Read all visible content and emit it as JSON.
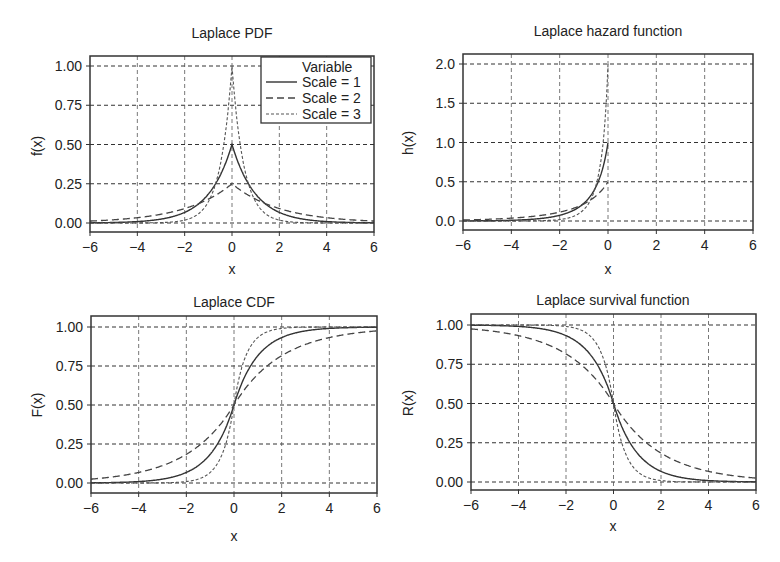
{
  "legend": {
    "title": "Variable",
    "entries": [
      "Scale = 1",
      "Scale = 2",
      "Scale = 3"
    ]
  },
  "panels": [
    {
      "id": "pdf",
      "title": "Laplace PDF",
      "ylabel": "f(x)",
      "xlabel": "x",
      "yticks": [
        "0.00",
        "0.25",
        "0.50",
        "0.75",
        "1.00"
      ],
      "xticks": [
        "−6",
        "−4",
        "−2",
        "0",
        "2",
        "4",
        "6"
      ]
    },
    {
      "id": "hazard",
      "title": "Laplace hazard function",
      "ylabel": "h(x)",
      "xlabel": "x",
      "yticks": [
        "0.0",
        "0.5",
        "1.0",
        "1.5",
        "2.0"
      ],
      "xticks": [
        "−6",
        "−4",
        "−2",
        "0",
        "2",
        "4",
        "6"
      ]
    },
    {
      "id": "cdf",
      "title": "Laplace CDF",
      "ylabel": "F(x)",
      "xlabel": "x",
      "yticks": [
        "0.00",
        "0.25",
        "0.50",
        "0.75",
        "1.00"
      ],
      "xticks": [
        "−6",
        "−4",
        "−2",
        "0",
        "2",
        "4",
        "6"
      ]
    },
    {
      "id": "survival",
      "title": "Laplace survival function",
      "ylabel": "R(x)",
      "xlabel": "x",
      "yticks": [
        "0.00",
        "0.25",
        "0.50",
        "0.75",
        "1.00"
      ],
      "xticks": [
        "−6",
        "−4",
        "−2",
        "0",
        "2",
        "4",
        "6"
      ]
    }
  ],
  "chart_data": [
    {
      "type": "line",
      "title": "Laplace PDF",
      "xlabel": "x",
      "ylabel": "f(x)",
      "xlim": [
        -6,
        6
      ],
      "ylim": [
        -0.05,
        1.05
      ],
      "xticks": [
        -6,
        -4,
        -2,
        0,
        2,
        4,
        6
      ],
      "yticks": [
        0.0,
        0.25,
        0.5,
        0.75,
        1.0
      ],
      "grid": true,
      "legend": {
        "title": "Variable",
        "position": "upper right"
      },
      "x": [
        -6,
        -4,
        -2,
        -1,
        -0.5,
        0,
        0.5,
        1,
        2,
        4,
        6
      ],
      "series": [
        {
          "name": "Scale = 1",
          "style": "solid",
          "values": [
            0.001,
            0.009,
            0.068,
            0.184,
            0.303,
            0.5,
            0.303,
            0.184,
            0.068,
            0.009,
            0.001
          ]
        },
        {
          "name": "Scale = 2",
          "style": "dashed",
          "values": [
            0.012,
            0.034,
            0.092,
            0.152,
            0.195,
            0.25,
            0.195,
            0.152,
            0.092,
            0.034,
            0.012
          ]
        },
        {
          "name": "Scale = 3",
          "style": "dotted",
          "values": [
            0.0,
            0.0,
            0.018,
            0.135,
            0.368,
            1.0,
            0.368,
            0.135,
            0.018,
            0.0,
            0.0
          ]
        }
      ]
    },
    {
      "type": "line",
      "title": "Laplace hazard function",
      "xlabel": "x",
      "ylabel": "h(x)",
      "xlim": [
        -6,
        6
      ],
      "ylim": [
        -0.1,
        2.1
      ],
      "xticks": [
        -6,
        -4,
        -2,
        0,
        2,
        4,
        6
      ],
      "yticks": [
        0.0,
        0.5,
        1.0,
        1.5,
        2.0
      ],
      "grid": true,
      "x": [
        -6,
        -4,
        -2,
        -1,
        -0.5,
        -0.25,
        0
      ],
      "series": [
        {
          "name": "Scale = 1",
          "style": "solid",
          "values": [
            0.001,
            0.009,
            0.072,
            0.225,
            0.436,
            0.639,
            1.0
          ]
        },
        {
          "name": "Scale = 2",
          "style": "dashed",
          "values": [
            0.013,
            0.039,
            0.112,
            0.209,
            0.281,
            0.335,
            0.5
          ]
        },
        {
          "name": "Scale = 3",
          "style": "dotted",
          "values": [
            0.0,
            0.0,
            0.037,
            0.313,
            0.873,
            1.277,
            2.0
          ]
        }
      ]
    },
    {
      "type": "line",
      "title": "Laplace CDF",
      "xlabel": "x",
      "ylabel": "F(x)",
      "xlim": [
        -6,
        6
      ],
      "ylim": [
        -0.05,
        1.05
      ],
      "xticks": [
        -6,
        -4,
        -2,
        0,
        2,
        4,
        6
      ],
      "yticks": [
        0.0,
        0.25,
        0.5,
        0.75,
        1.0
      ],
      "grid": true,
      "x": [
        -6,
        -4,
        -2,
        -1,
        0,
        1,
        2,
        4,
        6
      ],
      "series": [
        {
          "name": "Scale = 1",
          "style": "solid",
          "values": [
            0.001,
            0.009,
            0.068,
            0.184,
            0.5,
            0.816,
            0.932,
            0.991,
            0.999
          ]
        },
        {
          "name": "Scale = 2",
          "style": "dashed",
          "values": [
            0.025,
            0.068,
            0.184,
            0.303,
            0.5,
            0.697,
            0.816,
            0.932,
            0.975
          ]
        },
        {
          "name": "Scale = 3",
          "style": "dotted",
          "values": [
            0.0,
            0.0,
            0.009,
            0.068,
            0.5,
            0.932,
            0.991,
            1.0,
            1.0
          ]
        }
      ]
    },
    {
      "type": "line",
      "title": "Laplace survival function",
      "xlabel": "x",
      "ylabel": "R(x)",
      "xlim": [
        -6,
        6
      ],
      "ylim": [
        -0.05,
        1.05
      ],
      "xticks": [
        -6,
        -4,
        -2,
        0,
        2,
        4,
        6
      ],
      "yticks": [
        0.0,
        0.25,
        0.5,
        0.75,
        1.0
      ],
      "grid": true,
      "x": [
        -6,
        -4,
        -2,
        -1,
        0,
        1,
        2,
        4,
        6
      ],
      "series": [
        {
          "name": "Scale = 1",
          "style": "solid",
          "values": [
            0.999,
            0.991,
            0.932,
            0.816,
            0.5,
            0.184,
            0.068,
            0.009,
            0.001
          ]
        },
        {
          "name": "Scale = 2",
          "style": "dashed",
          "values": [
            0.975,
            0.932,
            0.816,
            0.697,
            0.5,
            0.303,
            0.184,
            0.068,
            0.025
          ]
        },
        {
          "name": "Scale = 3",
          "style": "dotted",
          "values": [
            1.0,
            1.0,
            0.991,
            0.932,
            0.5,
            0.068,
            0.009,
            0.0,
            0.0
          ]
        }
      ]
    }
  ]
}
